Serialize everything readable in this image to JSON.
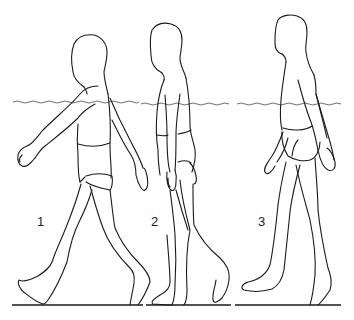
{
  "illustration": {
    "subject": "three children walking in water, side view",
    "figures": [
      {
        "label": "1",
        "pose": "long stride, arm swung forward"
      },
      {
        "label": "2",
        "pose": "upright, arms at sides"
      },
      {
        "label": "3",
        "pose": "stride, arms slightly back"
      }
    ],
    "colors": {
      "line": "#1a1a1a",
      "water": "#6e6e6e",
      "background": "#ffffff"
    }
  }
}
